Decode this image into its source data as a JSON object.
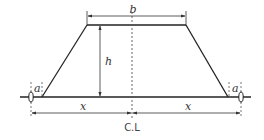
{
  "diagram": {
    "labels": {
      "top_width": "b",
      "height": "h",
      "left_offset": "a",
      "right_offset": "a",
      "left_half_base": "x",
      "right_half_base": "x",
      "centerline": "C.L"
    },
    "colors": {
      "line": "#222222",
      "dim_line": "#333333",
      "dashed": "#555555",
      "background": "#ffffff"
    }
  }
}
